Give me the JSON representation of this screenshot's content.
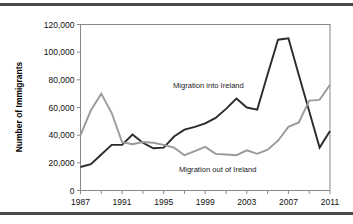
{
  "figure": {
    "has_top_rule": true,
    "has_bottom_rule": true,
    "rule_color": "#4a4a4a"
  },
  "chart_data": {
    "type": "line",
    "title": "",
    "subtitle": "",
    "xlabel": "",
    "ylabel": "Number of Immigrants",
    "xlim": [
      1987,
      2011
    ],
    "ylim": [
      0,
      120000
    ],
    "grid": false,
    "legend_position": "inline-annotation",
    "x": [
      1987,
      1988,
      1989,
      1990,
      1991,
      1992,
      1993,
      1994,
      1995,
      1996,
      1997,
      1998,
      1999,
      2000,
      2001,
      2002,
      2003,
      2004,
      2005,
      2006,
      2007,
      2008,
      2009,
      2010,
      2011
    ],
    "x_tick_values": [
      1987,
      1989,
      1991,
      1993,
      1995,
      1997,
      1999,
      2001,
      2003,
      2005,
      2007,
      2009,
      2011
    ],
    "x_tick_labels": [
      "1987",
      "",
      "1991",
      "",
      "1995",
      "",
      "1999",
      "",
      "2003",
      "",
      "2007",
      "",
      "2011"
    ],
    "x_major_labels": [
      "1987",
      "1991",
      "1995",
      "1999",
      "2003",
      "2007",
      "2011"
    ],
    "y_tick_values": [
      0,
      20000,
      40000,
      60000,
      80000,
      100000,
      120000
    ],
    "y_tick_labels": [
      "0",
      "20,000",
      "40,000",
      "60,000",
      "80,000",
      "100,000",
      "120,000"
    ],
    "series": [
      {
        "name": "Migration into Ireland",
        "color": "#2b2b2b",
        "stroke_width": 1.9,
        "annotation": "Migration into Ireland",
        "annotation_x": 1999.3,
        "annotation_y": 74000,
        "values": [
          17000,
          19000,
          26000,
          33000,
          33000,
          40500,
          34500,
          30500,
          31000,
          39000,
          44000,
          46000,
          48500,
          52500,
          59000,
          66500,
          60000,
          58500,
          84000,
          109000,
          110000,
          83500,
          57300,
          31000,
          43000
        ]
      },
      {
        "name": "Migration out of Ireland",
        "color": "#9a9a9a",
        "stroke_width": 1.9,
        "annotation": "Migration out of Ireland",
        "annotation_x": 2000.2,
        "annotation_y": 13500,
        "values": [
          40000,
          58000,
          70000,
          56000,
          35000,
          33500,
          35000,
          34500,
          33000,
          31000,
          25500,
          28500,
          31500,
          26500,
          26000,
          25500,
          29000,
          26500,
          29500,
          36000,
          46000,
          49200,
          65000,
          65500,
          76500
        ]
      }
    ]
  }
}
